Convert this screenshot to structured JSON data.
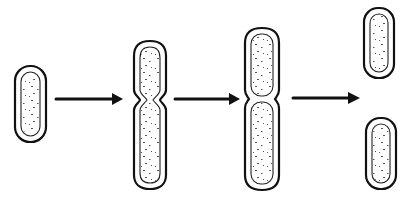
{
  "diagram": {
    "stages": [
      {
        "id": "single-cell",
        "label": ""
      },
      {
        "id": "constricting-cell",
        "label": ""
      },
      {
        "id": "septum-formed",
        "label": ""
      },
      {
        "id": "daughter-cells",
        "label": ""
      }
    ],
    "arrows": 3,
    "colors": {
      "stroke": "#111111",
      "fill": "#ffffff",
      "speckle": "#555555"
    }
  }
}
